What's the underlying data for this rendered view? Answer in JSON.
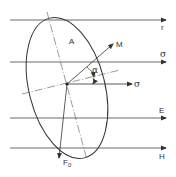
{
  "diagram": {
    "labels": {
      "area": "A",
      "moment": "M",
      "sigma_line": "σ",
      "sigma_arrow": "σ",
      "alpha": "α",
      "r_line": "r",
      "e_line": "E",
      "h_line": "H",
      "force": "F",
      "force_sub": "0"
    },
    "colors": {
      "stroke": "#333333",
      "background": "#ffffff"
    },
    "horizontal_lines": [
      {
        "label": "r",
        "y": 20
      },
      {
        "label": "σ",
        "y": 62
      },
      {
        "label": "E",
        "y": 118
      },
      {
        "label": "H",
        "y": 148
      }
    ]
  }
}
